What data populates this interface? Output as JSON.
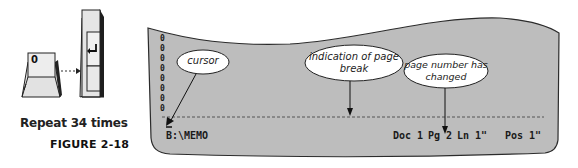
{
  "figure": {
    "label": "FIGURE 2-18",
    "instruction": "Repeat 34 times",
    "keys": [
      {
        "name": "zero-key",
        "label": "0"
      },
      {
        "name": "enter-key",
        "label": "↵"
      }
    ]
  },
  "screen": {
    "left_column_chars": [
      "0",
      "0",
      "0",
      "0",
      "0",
      "0",
      "0",
      "0"
    ],
    "status_bar": {
      "path": "B:\\MEMO",
      "doc": "Doc 1",
      "page": "Pg 2",
      "line": "Ln 1\"",
      "position": "Pos 1\""
    },
    "callouts": {
      "cursor": "cursor",
      "page_break_line1": "indication of page",
      "page_break_line2": "break",
      "page_number_line1": "page number has",
      "page_number_line2": "changed"
    }
  },
  "colors": {
    "screen_fill": "#bdbdbd",
    "screen_border": "#333333",
    "callout_fill": "#ffffff",
    "text": "#1a1a1a"
  }
}
